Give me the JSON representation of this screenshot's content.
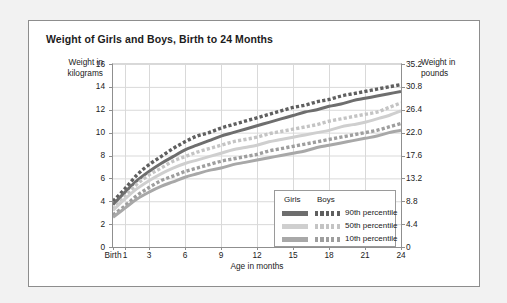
{
  "chart_data": {
    "type": "line",
    "title": "Weight of Girls and Boys, Birth to 24 Months",
    "xlabel": "Age in months",
    "ylabel": "Weight in kilograms",
    "ylabel_right": "Weight in pounds",
    "xlim": [
      0,
      24
    ],
    "ylim": [
      0,
      16
    ],
    "grid": true,
    "legend_position": "bottom-right",
    "xticks": [
      "Birth",
      "1",
      "3",
      "6",
      "9",
      "12",
      "15",
      "18",
      "21",
      "24"
    ],
    "xtick_values": [
      0,
      1,
      3,
      6,
      9,
      12,
      15,
      18,
      21,
      24
    ],
    "yticks_left": [
      "0",
      "2",
      "4",
      "6",
      "8",
      "10",
      "12",
      "14",
      "16"
    ],
    "ytick_values_left": [
      0,
      2,
      4,
      6,
      8,
      10,
      12,
      14,
      16
    ],
    "yticks_right": [
      "0",
      "4.4",
      "8.8",
      "13.2",
      "17.6",
      "22.0",
      "26.4",
      "30.8",
      "35.2"
    ],
    "ytick_values_right": [
      0,
      4.4,
      8.8,
      13.2,
      17.6,
      22.0,
      26.4,
      30.8,
      35.2
    ],
    "x": [
      0,
      1,
      2,
      3,
      4,
      5,
      6,
      7,
      8,
      9,
      10,
      11,
      12,
      13,
      14,
      15,
      16,
      17,
      18,
      19,
      20,
      21,
      22,
      23,
      24
    ],
    "series": [
      {
        "name": "Boys 90th percentile",
        "group": "Boys",
        "percentile": "90th percentile",
        "style": "dashed",
        "color": "#5f5f5f",
        "values": [
          4.0,
          5.1,
          6.3,
          7.2,
          7.9,
          8.6,
          9.2,
          9.7,
          10.0,
          10.4,
          10.7,
          11.0,
          11.3,
          11.6,
          11.9,
          12.2,
          12.4,
          12.7,
          12.9,
          13.2,
          13.4,
          13.6,
          13.8,
          14.0,
          14.2
        ]
      },
      {
        "name": "Girls 90th percentile",
        "group": "Girls",
        "percentile": "90th percentile",
        "style": "solid",
        "color": "#6e6e6e",
        "values": [
          3.7,
          4.8,
          5.8,
          6.6,
          7.3,
          7.9,
          8.5,
          8.9,
          9.3,
          9.7,
          10.0,
          10.3,
          10.6,
          10.9,
          11.2,
          11.5,
          11.8,
          12.0,
          12.3,
          12.5,
          12.8,
          13.0,
          13.2,
          13.4,
          13.6
        ]
      },
      {
        "name": "Boys 50th percentile",
        "group": "Boys",
        "percentile": "50th percentile",
        "style": "dashed",
        "color": "#c4c4c4",
        "values": [
          3.3,
          4.4,
          5.5,
          6.3,
          6.9,
          7.5,
          7.9,
          8.3,
          8.6,
          8.9,
          9.2,
          9.4,
          9.6,
          9.9,
          10.1,
          10.3,
          10.5,
          10.7,
          11.0,
          11.2,
          11.4,
          11.6,
          11.8,
          12.2,
          12.6
        ]
      },
      {
        "name": "Girls 50th percentile",
        "group": "Girls",
        "percentile": "50th percentile",
        "style": "solid",
        "color": "#cfcfcf",
        "values": [
          3.2,
          4.2,
          5.1,
          5.8,
          6.4,
          6.9,
          7.3,
          7.6,
          7.9,
          8.2,
          8.5,
          8.7,
          8.9,
          9.2,
          9.4,
          9.6,
          9.8,
          10.0,
          10.2,
          10.5,
          10.7,
          10.9,
          11.2,
          11.5,
          11.9
        ]
      },
      {
        "name": "Boys 10th percentile",
        "group": "Boys",
        "percentile": "10th percentile",
        "style": "dashed",
        "color": "#9e9e9e",
        "values": [
          2.8,
          3.6,
          4.5,
          5.2,
          5.8,
          6.2,
          6.6,
          6.9,
          7.2,
          7.5,
          7.7,
          7.9,
          8.1,
          8.4,
          8.6,
          8.8,
          9.0,
          9.2,
          9.4,
          9.6,
          9.8,
          10.0,
          10.2,
          10.5,
          10.8
        ]
      },
      {
        "name": "Girls 10th percentile",
        "group": "Girls",
        "percentile": "10th percentile",
        "style": "solid",
        "color": "#a8a8a8",
        "values": [
          2.6,
          3.4,
          4.2,
          4.8,
          5.3,
          5.7,
          6.1,
          6.4,
          6.7,
          6.9,
          7.2,
          7.4,
          7.6,
          7.8,
          8.0,
          8.2,
          8.4,
          8.7,
          8.9,
          9.1,
          9.3,
          9.5,
          9.7,
          10.0,
          10.2
        ]
      }
    ]
  },
  "legend": {
    "header_girls": "Girls",
    "header_boys": "Boys",
    "rows": [
      {
        "label": "90th percentile",
        "girls_color": "#6e6e6e",
        "boys_color": "#5f5f5f"
      },
      {
        "label": "50th percentile",
        "girls_color": "#cfcfcf",
        "boys_color": "#c4c4c4"
      },
      {
        "label": "10th percentile",
        "girls_color": "#a8a8a8",
        "boys_color": "#9e9e9e"
      }
    ]
  },
  "colors": {
    "card_background": "#ffffff",
    "page_background": "#f2f2f2",
    "border": "#8d8d8d",
    "gridline": "#d9d9d9",
    "axis": "#8f8f8f",
    "text": "#222222"
  }
}
